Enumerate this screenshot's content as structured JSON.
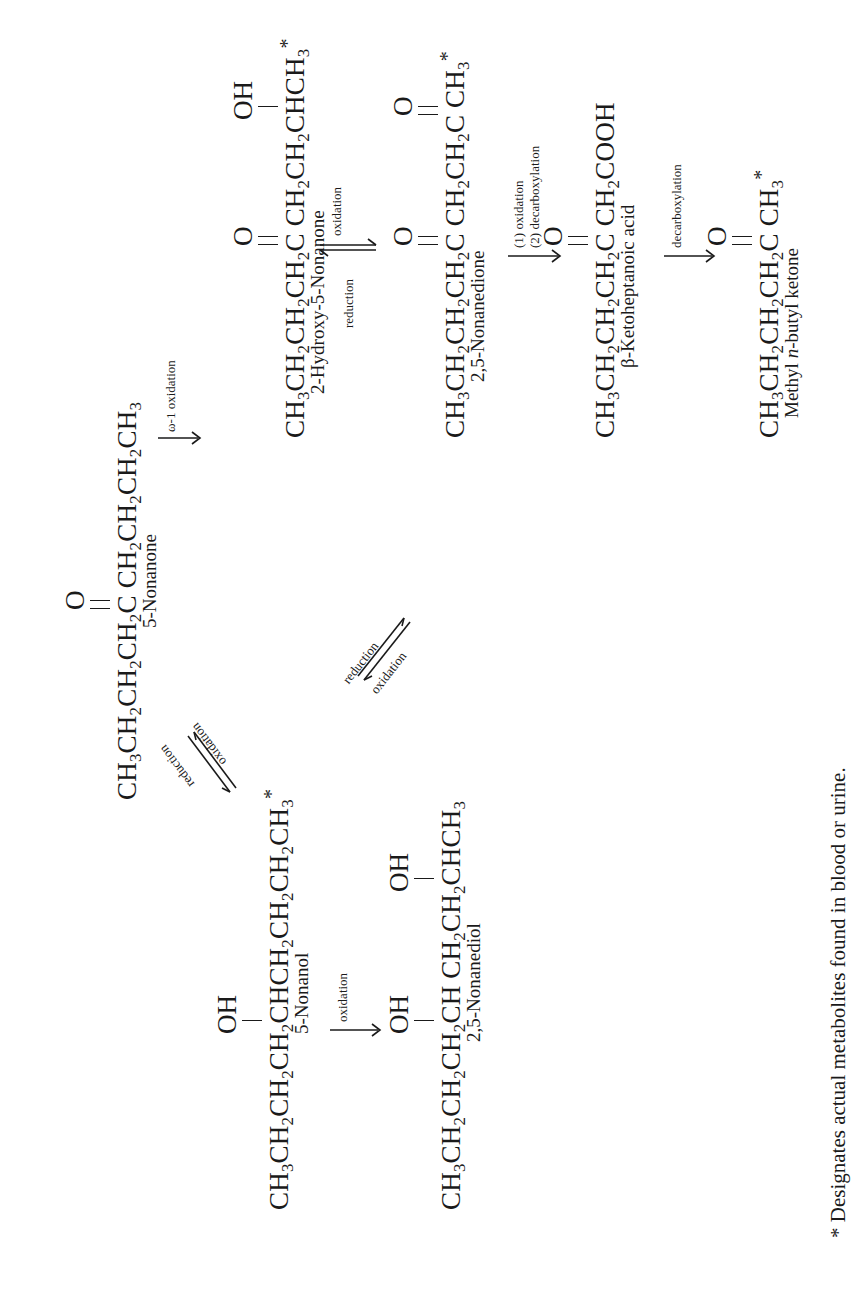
{
  "compounds": {
    "nonanone": {
      "formula_parts": [
        "CH",
        "3",
        "CH",
        "2",
        "CH",
        "2",
        "CH",
        "2",
        "C",
        "CH",
        "2",
        "CH",
        "2",
        "CH",
        "2",
        "CH",
        "3"
      ],
      "formula_text": "CH3CH2CH2CH2CCH2CH2CH2CH3",
      "substituent": "O",
      "name": "5-Nonanone",
      "metabolite": false
    },
    "hydroxy_nonanone": {
      "formula_text": "CH3CH2CH2CH2CCH2CH2CHCH3",
      "substituents": [
        "O",
        "OH"
      ],
      "name": "2-Hydroxy-5-Nonanone",
      "metabolite": true
    },
    "nonanedione": {
      "formula_text": "CH3CH2CH2CH2CCH2CH2CCH3",
      "substituents": [
        "O",
        "O"
      ],
      "name": "2,5-Nonanedione",
      "metabolite": true
    },
    "ketoheptanoic": {
      "formula_text": "CH3CH2CH2CH2CCH2COOH",
      "substituent": "O",
      "name": "β-Ketoheptanoic acid",
      "metabolite": false
    },
    "mbk": {
      "formula_text": "CH3CH2CH2CH2CCH3",
      "substituent": "O",
      "name_prefix": "Methyl ",
      "name_italic": "n",
      "name_suffix": "-butyl ketone",
      "metabolite": true
    },
    "nonanol": {
      "formula_text": "CH3CH2CH2CH2CHCH2CH2CH2CH3",
      "substituent": "OH",
      "name": "5-Nonanol",
      "metabolite": true
    },
    "nonanediol": {
      "formula_text": "CH3CH2CH2CH2CHCH2CH2CHCH3",
      "substituents": [
        "OH",
        "OH"
      ],
      "name": "2,5-Nonanediol",
      "metabolite": false
    }
  },
  "arrows": {
    "omega": "ω-1 oxidation",
    "hn_forward": "oxidation",
    "hn_reverse": "reduction",
    "dione_step1": "(1)  oxidation",
    "dione_step2": "(2)  decarboxylation",
    "keto_step": "decarboxylation",
    "nonanol_ox": "oxidation",
    "nonanol_red": "reduction",
    "nonanol_forward": "oxidation",
    "diol_ox": "oxidation",
    "diol_red": "reduction"
  },
  "symbols": {
    "O": "O",
    "OH": "OH",
    "asterisk": "*"
  },
  "footnote": "* Designates actual metabolites found in blood or urine."
}
